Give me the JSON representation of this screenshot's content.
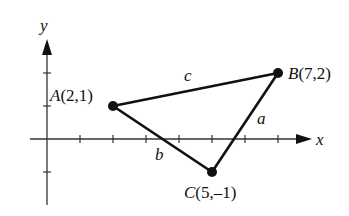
{
  "diagram": {
    "axes": {
      "x_label": "x",
      "y_label": "y",
      "x_ticks": [
        1,
        2,
        3,
        4,
        5,
        6,
        7
      ],
      "y_ticks": [
        -1,
        1,
        2
      ]
    },
    "points": [
      {
        "id": "A",
        "x": 2,
        "y": 1,
        "label_name": "A",
        "label_coords": "(2,1)"
      },
      {
        "id": "B",
        "x": 7,
        "y": 2,
        "label_name": "B",
        "label_coords": "(7,2)"
      },
      {
        "id": "C",
        "x": 5,
        "y": -1,
        "label_name": "C",
        "label_coords": "(5,–1)"
      }
    ],
    "sides": [
      {
        "from": "A",
        "to": "B",
        "label": "c"
      },
      {
        "from": "B",
        "to": "C",
        "label": "a"
      },
      {
        "from": "C",
        "to": "A",
        "label": "b"
      }
    ],
    "colors": {
      "ink": "#111111"
    }
  }
}
